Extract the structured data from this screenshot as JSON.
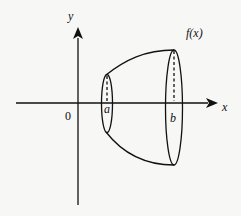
{
  "diagram": {
    "type": "solid-of-revolution",
    "axes": {
      "x_label": "x",
      "y_label": "y",
      "origin_label": "0"
    },
    "curve_label": "f(x)",
    "bounds": {
      "left": "a",
      "right": "b"
    },
    "colors": {
      "stroke": "#111111",
      "background": "#f7f7f5"
    }
  }
}
